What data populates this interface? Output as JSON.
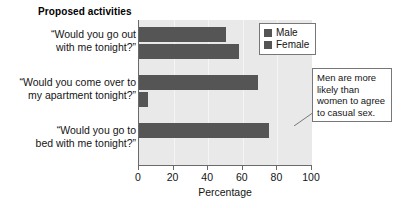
{
  "chart_data": {
    "type": "bar",
    "orientation": "horizontal",
    "title": "Proposed activities",
    "xlabel": "Percentage",
    "ylabel": "",
    "xlim": [
      0,
      100
    ],
    "xticks": [
      0,
      20,
      40,
      60,
      80,
      100
    ],
    "grid": true,
    "legend_position": "top-right",
    "categories": [
      "“Would you go out with me tonight?”",
      "“Would you come over to my apartment tonight?”",
      "“Would you go to bed with me tonight?”"
    ],
    "category_lines": [
      [
        "“Would you go out",
        "with me tonight?”"
      ],
      [
        "“Would you come over to",
        "my apartment tonight?”"
      ],
      [
        "“Would you go to",
        "bed with me tonight?”"
      ]
    ],
    "series": [
      {
        "name": "Male",
        "color": "#555555",
        "values": [
          50,
          69,
          75
        ]
      },
      {
        "name": "Female",
        "color": "#555555",
        "values": [
          58,
          5,
          0
        ]
      }
    ],
    "annotations": [
      {
        "text": "Men are more likely than women to agree to casual sex.",
        "lines": [
          "Men are more",
          "likely than",
          "women to agree",
          "to casual sex."
        ]
      }
    ],
    "colors": {
      "plot_background": "#e9e9e9",
      "bar": "#555555",
      "axis": "#6a6a6a",
      "page_background": "#ffffff"
    }
  },
  "chart": {
    "title": "Proposed activities",
    "axis_title": "Percentage",
    "tick_labels": [
      "0",
      "20",
      "40",
      "60",
      "80",
      "100"
    ],
    "legend": [
      {
        "label": "Male"
      },
      {
        "label": "Female"
      }
    ],
    "callout_lines": [
      "Men are more",
      "likely than",
      "women to agree",
      "to casual sex."
    ],
    "cat0_line0": "“Would you go out",
    "cat0_line1": "with me tonight?”",
    "cat1_line0": "“Would you come over to",
    "cat1_line1": "my apartment tonight?”",
    "cat2_line0": "“Would you go to",
    "cat2_line1": "bed with me tonight?”"
  }
}
